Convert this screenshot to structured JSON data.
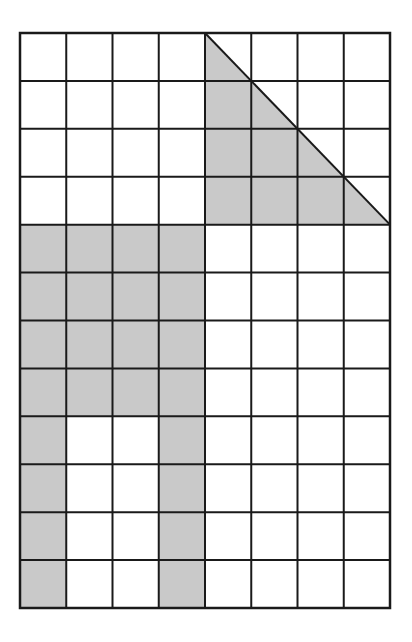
{
  "figure": {
    "grid": {
      "columns": 8,
      "rows": 12,
      "left": 20,
      "top": 33,
      "right": 390,
      "bottom": 608
    },
    "colors": {
      "background": "#ffffff",
      "shade": "#c9c9c9",
      "line": "#1a1a1a"
    },
    "shaded_cells": [
      [
        4,
        0
      ],
      [
        5,
        0
      ],
      [
        6,
        0
      ],
      [
        7,
        0
      ],
      [
        4,
        1
      ],
      [
        5,
        1
      ],
      [
        6,
        1
      ],
      [
        7,
        1
      ],
      [
        4,
        2
      ],
      [
        5,
        2
      ],
      [
        6,
        2
      ],
      [
        7,
        2
      ],
      [
        4,
        3
      ],
      [
        5,
        3
      ],
      [
        6,
        3
      ],
      [
        7,
        3
      ],
      [
        0,
        4
      ],
      [
        0,
        5
      ],
      [
        0,
        6
      ],
      [
        0,
        7
      ],
      [
        1,
        4
      ],
      [
        1,
        5
      ],
      [
        1,
        6
      ],
      [
        1,
        7
      ],
      [
        2,
        4
      ],
      [
        2,
        5
      ],
      [
        2,
        6
      ],
      [
        2,
        7
      ],
      [
        3,
        4
      ],
      [
        3,
        5
      ],
      [
        3,
        6
      ],
      [
        3,
        7
      ],
      [
        0,
        8
      ],
      [
        0,
        9
      ],
      [
        0,
        10
      ],
      [
        0,
        11
      ],
      [
        3,
        8
      ],
      [
        3,
        9
      ],
      [
        3,
        10
      ],
      [
        3,
        11
      ]
    ],
    "triangle": {
      "vertices_grid": [
        [
          4,
          0
        ],
        [
          4,
          4
        ],
        [
          8,
          4
        ]
      ],
      "note": "Shaded right triangle occupying columns 4-8, rows 0-4, with hypotenuse from top of column line 4 to right edge at row line 4"
    }
  }
}
